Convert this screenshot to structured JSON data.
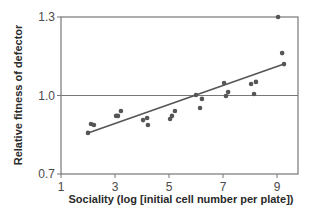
{
  "chart_data": {
    "type": "scatter",
    "title": "",
    "xlabel": "Sociality (log [initial cell number per plate])",
    "ylabel": "Relative fitness of defector",
    "xlim": [
      1,
      9.75
    ],
    "ylim": [
      0.7,
      1.3
    ],
    "xticks": [
      1,
      3,
      5,
      7,
      9
    ],
    "xtick_labels": [
      "1",
      "3",
      "5",
      "7",
      "9"
    ],
    "yticks": [
      0.7,
      1.0,
      1.3
    ],
    "ytick_labels": [
      "0.7",
      "1.0",
      "1.3"
    ],
    "grid": false,
    "reference_line": {
      "y": 1.0
    },
    "legend": null,
    "series": [
      {
        "name": "defector fitness",
        "points": [
          [
            2.0,
            0.857
          ],
          [
            2.11,
            0.891
          ],
          [
            2.22,
            0.887
          ],
          [
            3.04,
            0.922
          ],
          [
            3.11,
            0.922
          ],
          [
            3.22,
            0.941
          ],
          [
            4.04,
            0.906
          ],
          [
            4.19,
            0.914
          ],
          [
            4.22,
            0.887
          ],
          [
            5.04,
            0.91
          ],
          [
            5.11,
            0.922
          ],
          [
            5.22,
            0.941
          ],
          [
            6.0,
            1.002
          ],
          [
            6.15,
            0.952
          ],
          [
            6.22,
            0.987
          ],
          [
            7.04,
            1.048
          ],
          [
            7.11,
            0.998
          ],
          [
            7.19,
            1.013
          ],
          [
            8.04,
            1.044
          ],
          [
            8.15,
            1.006
          ],
          [
            8.22,
            1.052
          ],
          [
            9.04,
            1.3
          ],
          [
            9.19,
            1.162
          ],
          [
            9.26,
            1.12
          ]
        ]
      }
    ],
    "fit_line": {
      "x": [
        2.0,
        9.26
      ],
      "y": [
        0.857,
        1.12
      ]
    }
  },
  "colors": {
    "axis": "#777777",
    "point": "#555555",
    "fit_line": "#555555",
    "reference_line": "#777777"
  }
}
